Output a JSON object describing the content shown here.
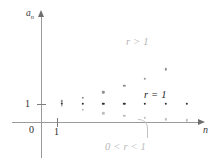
{
  "figure": {
    "background_color": "#ffffff"
  },
  "axes": {
    "y_label": "a",
    "y_label_subscript": "n",
    "x_label": "n",
    "origin_label": "0",
    "y_tick_label": "1",
    "x_tick_label": "1",
    "axis_color": "#9a9a9a",
    "arrow_color": "#6e6e6e"
  },
  "annotations": {
    "growing": "r > 1",
    "constant": "r = 1",
    "decaying": "0 < r < 1",
    "growing_color": "#b4b4b4",
    "constant_color": "#232323",
    "decaying_color": "#b9b9b9"
  },
  "chart_data": {
    "type": "scatter",
    "xlabel": "n",
    "ylabel": "a_n",
    "xlim": [
      0,
      8.2
    ],
    "ylim": [
      0,
      3.1
    ],
    "grid": false,
    "legend": "inline-annotations",
    "x_ticks": [
      1
    ],
    "y_ticks": [
      1
    ],
    "x_tick_labels": [
      "1"
    ],
    "y_tick_labels": [
      "1"
    ],
    "series": [
      {
        "name": "r > 1",
        "label": "r > 1",
        "color": "#8f8f8f",
        "x": [
          1,
          2,
          3,
          4,
          5,
          6
        ],
        "y": [
          1.12,
          1.32,
          1.6,
          1.95,
          2.35,
          2.85
        ]
      },
      {
        "name": "r = 1",
        "label": "r = 1",
        "color": "#2f2f2f",
        "x": [
          1,
          2,
          3,
          4,
          5,
          6,
          7
        ],
        "y": [
          1,
          1,
          1,
          1,
          1,
          1,
          1
        ]
      },
      {
        "name": "0 < r < 1",
        "label": "0 < r < 1",
        "color": "#bdbdbd",
        "x": [
          1,
          2,
          3,
          4,
          5,
          6,
          7
        ],
        "y": [
          0.88,
          0.66,
          0.47,
          0.33,
          0.22,
          0.15,
          0.1
        ]
      }
    ]
  }
}
